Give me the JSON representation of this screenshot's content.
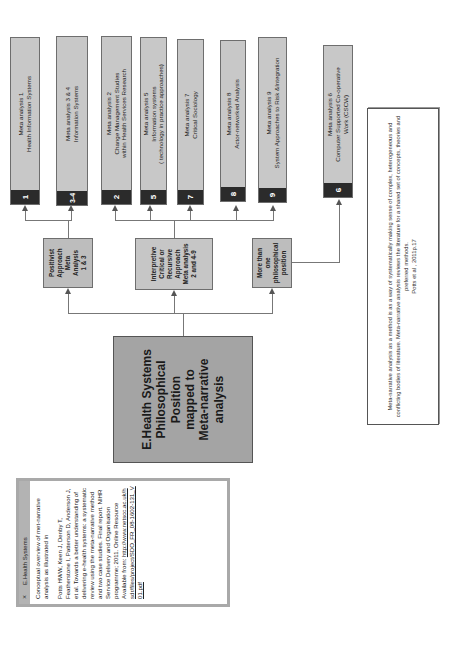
{
  "diagram": {
    "central": {
      "label": "E.Health Systems\nPhilosophical Position\nmapped to\nMeta-narrative\nanalysis"
    },
    "approaches": [
      {
        "id": "positivist",
        "label": "Positivist\nApproach\nMeta\nAnalysis\n1 & 3"
      },
      {
        "id": "interpretive",
        "label": "Interpretive\nCritical or\nRecursive\nApproach\nMeta analysis\n2 and 4-9"
      },
      {
        "id": "more-than-one",
        "label": "More than\none\nphilosophical\nposition"
      }
    ],
    "meta_analyses": [
      {
        "num": "1",
        "line1": "Meta analysis 1",
        "line2": "Health Information Systems",
        "line3": ""
      },
      {
        "num": "3-4",
        "line1": "Meta analysis 3 & 4",
        "line2": "Information Systems",
        "line3": ""
      },
      {
        "num": "2",
        "line1": "Meta analysis 2",
        "line2": "Change Management Studies",
        "line3": "within Health Services Research"
      },
      {
        "num": "5",
        "line1": "Meta analysis 5",
        "line2": "Information systems",
        "line3": "( technology in practice approaches)"
      },
      {
        "num": "7",
        "line1": "Meta analysis 7",
        "line2": "Critical Sociology",
        "line3": ""
      },
      {
        "num": "8",
        "line1": "Meta analysis 8",
        "line2": "Actor-networked Analysis",
        "line3": ""
      },
      {
        "num": "9",
        "line1": "Meta analysis 9",
        "line2": "System Approaches to Risk &Integration",
        "line3": ""
      },
      {
        "num": "6",
        "line1": "Meta analysis 6",
        "line2": "Computer Supported Co-operative",
        "line3": "Work (CSCW)"
      }
    ],
    "quote": {
      "text": "Meta-narrative analysis  as a method is as a way of systematically making sense of complex, heterogeneous and conflicting bodies of literature. Meta-narrative analysis reviews the literature for a shared set of concepts, theories and preferred methods.",
      "citation": "Potts et al , 2011p.17"
    },
    "note": {
      "title": "E.Health Systems",
      "close_icon": "×",
      "intro": "Conceptual overview of met-narrative analysis as illustrated in",
      "reference": "Potts HWW, Keen J, Denby T, Featherstone I, Patterson D, Anderson J, et al. Towards a better understanding of delivering e-health systems: a systematic review using the meta-narrative method and two case studies. Final report. NIHR Service Delivery and Organisation programme; 2011. Online Resource Available from:",
      "link": "http://www.netscc.ac.uk/hsdr/files/project/SDO_FR_08-1602-131_V01.pdf"
    },
    "colors": {
      "leaf_fill": "#c8c8c8",
      "number_tab": "#2b2b2b",
      "central_fill": "#a4a4a4",
      "connector": "#777777"
    }
  }
}
